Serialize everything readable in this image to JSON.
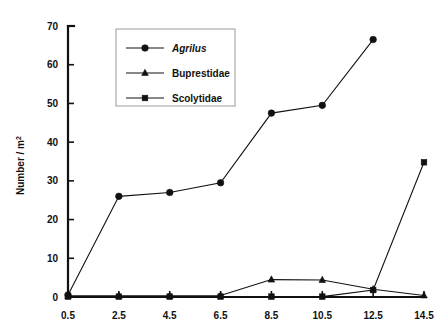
{
  "chart_data": {
    "type": "line",
    "title": "",
    "xlabel": "",
    "ylabel": "Number / m",
    "ylabel_sup": "2",
    "x": [
      0.5,
      2.5,
      4.5,
      6.5,
      8.5,
      10.5,
      12.5,
      14.5
    ],
    "xtick_labels": [
      "0.5",
      "2.5",
      "4.5",
      "6.5",
      "8.5",
      "10.5",
      "12.5",
      "14.5"
    ],
    "ytick_labels": [
      "0",
      "10",
      "20",
      "30",
      "40",
      "50",
      "60",
      "70"
    ],
    "ytick_values": [
      0,
      10,
      20,
      30,
      40,
      50,
      60,
      70
    ],
    "ylim": [
      0,
      70
    ],
    "xlim": [
      0.5,
      14.5
    ],
    "grid": false,
    "legend_position": "top-center-left",
    "series": [
      {
        "name": "Agrilus",
        "italic": true,
        "marker": "circle",
        "x": [
          0.5,
          2.5,
          4.5,
          6.5,
          8.5,
          10.5,
          12.5
        ],
        "values": [
          0.5,
          26.0,
          27.0,
          29.5,
          47.5,
          49.5,
          66.5
        ]
      },
      {
        "name": "Buprestidae",
        "italic": false,
        "marker": "triangle",
        "x": [
          0.5,
          2.5,
          4.5,
          6.5,
          8.5,
          10.5,
          12.5,
          14.5
        ],
        "values": [
          0.3,
          0.3,
          0.3,
          0.4,
          4.5,
          4.4,
          2.0,
          0.4
        ]
      },
      {
        "name": "Scolytidae",
        "italic": false,
        "marker": "square",
        "x": [
          0.5,
          2.5,
          4.5,
          6.5,
          8.5,
          10.5,
          12.5,
          14.5
        ],
        "values": [
          0.1,
          0.1,
          0.1,
          0.1,
          0.1,
          0.1,
          1.8,
          34.8
        ]
      }
    ]
  },
  "legend": {
    "entries": [
      {
        "label": "Agrilus"
      },
      {
        "label": "Buprestidae"
      },
      {
        "label": "Scolytidae"
      }
    ]
  }
}
